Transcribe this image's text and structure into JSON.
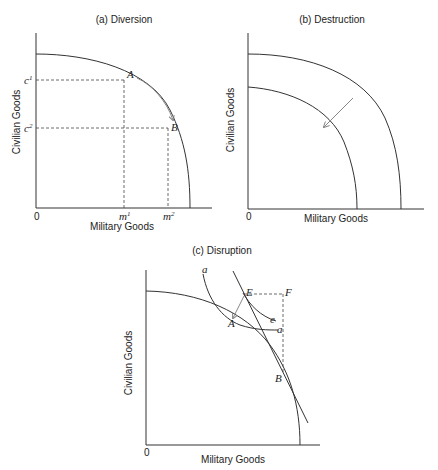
{
  "panels": {
    "a": {
      "title": "(a) Diversion",
      "ylabel": "Civilian Goods",
      "xlabel": "Military Goods",
      "origin": "0",
      "y_ticks": [
        "c",
        "c"
      ],
      "y_tick_sup": [
        "1",
        "2"
      ],
      "x_ticks": [
        "m",
        "m"
      ],
      "x_tick_sup": [
        "1",
        "2"
      ],
      "points": [
        "A",
        "B"
      ]
    },
    "b": {
      "title": "(b) Destruction",
      "ylabel": "Civilian Goods",
      "xlabel": "Military Goods",
      "origin": "0"
    },
    "c": {
      "title": "(c) Disruption",
      "ylabel": "Civilian Goods",
      "xlabel": "Military Goods",
      "origin": "0",
      "points": [
        "A",
        "B",
        "E",
        "F"
      ],
      "curve_labels": [
        "a",
        "a",
        "e"
      ]
    }
  },
  "colors": {
    "line": "#333333",
    "arrow": "#888888",
    "background": "#ffffff"
  }
}
